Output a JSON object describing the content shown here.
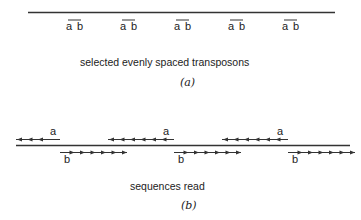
{
  "panel_a": {
    "transposon_labels": [
      {
        "left": "a",
        "right": "b"
      },
      {
        "left": "a",
        "right": "b"
      },
      {
        "left": "a",
        "right": "b"
      },
      {
        "left": "a",
        "right": "b"
      },
      {
        "left": "a",
        "right": "b"
      }
    ],
    "caption": "selected evenly spaced transposons",
    "panel_label": "(a)"
  },
  "panel_b": {
    "reads": [
      {
        "strand": "a",
        "label": "a",
        "direction": "left"
      },
      {
        "strand": "b",
        "label": "b",
        "direction": "right"
      },
      {
        "strand": "a",
        "label": "a",
        "direction": "left"
      },
      {
        "strand": "b",
        "label": "b",
        "direction": "right"
      },
      {
        "strand": "a",
        "label": "a",
        "direction": "left"
      },
      {
        "strand": "b",
        "label": "b",
        "direction": "right"
      }
    ],
    "caption": "sequences read",
    "panel_label": "(b)"
  }
}
